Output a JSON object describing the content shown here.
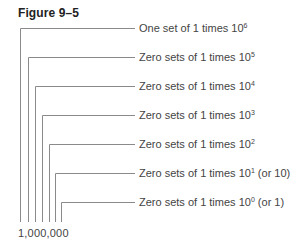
{
  "figure": {
    "title": "Figure 9–5",
    "number": "1,000,000",
    "line_color": "#8a8a8a",
    "places": [
      {
        "x": 20,
        "y": 28,
        "prefix": "One set of 1 times 10",
        "exp": "6",
        "suffix": ""
      },
      {
        "x": 28,
        "y": 57,
        "prefix": "Zero sets of 1 times 10",
        "exp": "5",
        "suffix": ""
      },
      {
        "x": 35,
        "y": 86,
        "prefix": "Zero sets of 1 times 10",
        "exp": "4",
        "suffix": ""
      },
      {
        "x": 42,
        "y": 115,
        "prefix": "Zero sets of 1 times 10",
        "exp": "3",
        "suffix": ""
      },
      {
        "x": 49,
        "y": 144,
        "prefix": "Zero sets of 1 times 10",
        "exp": "2",
        "suffix": ""
      },
      {
        "x": 55,
        "y": 173,
        "prefix": "Zero sets of 1 times 10",
        "exp": "1",
        "suffix": " (or 10)"
      },
      {
        "x": 61,
        "y": 202,
        "prefix": "Zero sets of 1 times 10",
        "exp": "0",
        "suffix": " (or 1)"
      }
    ]
  }
}
